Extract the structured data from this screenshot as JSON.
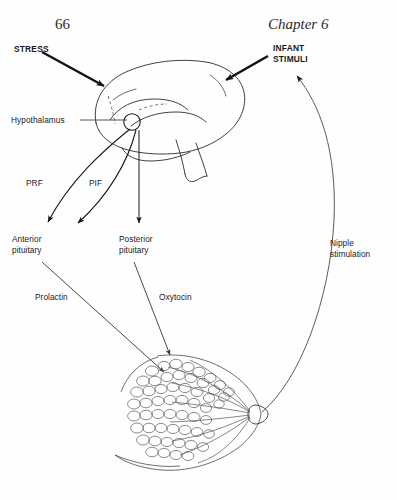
{
  "page": {
    "number": "66",
    "chapter": "Chapter 6",
    "width": 397,
    "height": 500,
    "background_color": "#fefefe",
    "ink_color": "#1a1a1a"
  },
  "figure": {
    "labels": {
      "stress": "STRESS",
      "infant_stimuli": "INFANT\nSTIMULI",
      "hypothalamus": "Hypothalamus",
      "prf": "PRF",
      "pif": "PIF",
      "anterior_pituitary": "Anterior\npituitary",
      "posterior_pituitary": "Posterior\npituitary",
      "prolactin": "Prolactin",
      "oxytocin": "Oxytocin",
      "nipple_stimulation": "Nipple\nstimulation"
    },
    "parts": {
      "brain": "brain-sagittal-outline",
      "hypothalamus_node": "hypothalamus-circle",
      "breast": "breast-alveoli-cross-section",
      "nipple": "nipple"
    },
    "arrows": [
      {
        "name": "stress-to-brain",
        "style": "thick-solid",
        "from": "STRESS",
        "to": "brain"
      },
      {
        "name": "infant-stimuli-to-brain",
        "style": "thick-solid",
        "from": "INFANT STIMULI",
        "to": "brain"
      },
      {
        "name": "hypothalamus-leader",
        "style": "thin-leader",
        "from": "Hypothalamus",
        "to": "hypothalamus-circle"
      },
      {
        "name": "prf-to-anterior-pituitary",
        "style": "curved-thin",
        "from": "hypothalamus",
        "to": "Anterior pituitary"
      },
      {
        "name": "pif-to-anterior-pituitary",
        "style": "curved-thin",
        "from": "hypothalamus",
        "to": "Anterior pituitary"
      },
      {
        "name": "hypothalamus-to-posterior-pituitary",
        "style": "straight-thin",
        "from": "hypothalamus",
        "to": "Posterior pituitary"
      },
      {
        "name": "prolactin-to-breast",
        "style": "straight-thin",
        "from": "Anterior pituitary",
        "to": "breast"
      },
      {
        "name": "oxytocin-to-breast",
        "style": "straight-thin",
        "from": "Posterior pituitary",
        "to": "breast"
      },
      {
        "name": "nipple-stimulation-feedback",
        "style": "long-curve",
        "from": "nipple",
        "to": "INFANT STIMULI"
      }
    ]
  }
}
